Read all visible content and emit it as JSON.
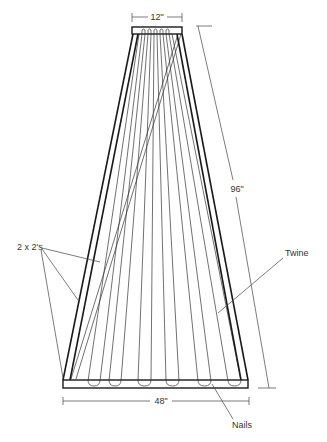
{
  "diagram": {
    "title": "",
    "dimensions": {
      "top_width": "12\"",
      "bottom_width": "48\"",
      "height": "96\""
    },
    "labels": {
      "frame_members": "2 x 2's",
      "twine": "Twine",
      "nails": "Nails"
    },
    "colors": {
      "line": "#1a1a1a",
      "text": "#333333",
      "background": "#ffffff"
    }
  }
}
